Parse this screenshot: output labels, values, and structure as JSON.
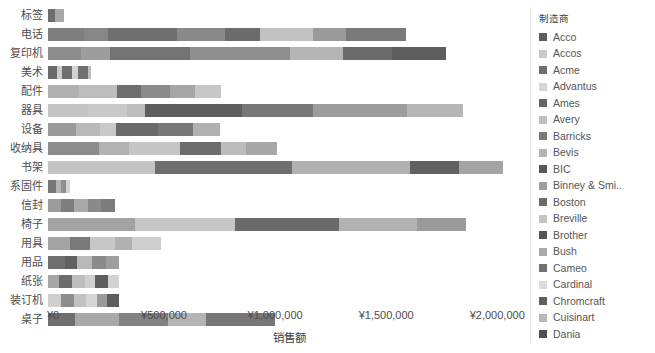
{
  "chart_data": {
    "type": "bar",
    "orientation": "horizontal",
    "stacked": true,
    "title": "",
    "xlabel": "销售额",
    "ylabel": "",
    "grid": false,
    "legend_position": "right",
    "legend_title": "制造商",
    "xlim": [
      0,
      2125000
    ],
    "xticks": [
      0,
      500000,
      1000000,
      1500000,
      2000000
    ],
    "xtick_labels": [
      "¥0",
      "¥500,000",
      "¥1,000,000",
      "¥1,500,000",
      "¥2,000,000"
    ],
    "categories": [
      "标签",
      "电话",
      "复印机",
      "美术",
      "配件",
      "器具",
      "设备",
      "收纳具",
      "书架",
      "系固件",
      "信封",
      "椅子",
      "用具",
      "用品",
      "纸张",
      "装订机",
      "桌子"
    ],
    "series": [
      {
        "name": "Acco",
        "color": "#5c5c5c"
      },
      {
        "name": "Accos",
        "color": "#c9c9c9"
      },
      {
        "name": "Acme",
        "color": "#6e6e6e"
      },
      {
        "name": "Advantus",
        "color": "#d6d6d6"
      },
      {
        "name": "Ames",
        "color": "#666666"
      },
      {
        "name": "Avery",
        "color": "#bfbfbf"
      },
      {
        "name": "Barricks",
        "color": "#7a7a7a"
      },
      {
        "name": "Bevis",
        "color": "#b3b3b3"
      },
      {
        "name": "BIC",
        "color": "#585858"
      },
      {
        "name": "Binney & Smi..",
        "color": "#9e9e9e"
      },
      {
        "name": "Boston",
        "color": "#6a6a6a"
      },
      {
        "name": "Breville",
        "color": "#c4c4c4"
      },
      {
        "name": "Brother",
        "color": "#545454"
      },
      {
        "name": "Bush",
        "color": "#aaaaaa"
      },
      {
        "name": "Cameo",
        "color": "#727272"
      },
      {
        "name": "Cardinal",
        "color": "#dcdcdc"
      },
      {
        "name": "Chromcraft",
        "color": "#5f5f5f"
      },
      {
        "name": "Cuisinart",
        "color": "#b8b8b8"
      },
      {
        "name": "Dania",
        "color": "#4f4f4f"
      }
    ],
    "bars": [
      {
        "category": "标签",
        "total": 70000,
        "segments": [
          {
            "value": 32000,
            "color": "#6e6e6e"
          },
          {
            "value": 38000,
            "color": "#a8a8a8"
          }
        ]
      },
      {
        "category": "电话",
        "total": 1610000,
        "segments": [
          {
            "value": 160000,
            "color": "#7f7f7f"
          },
          {
            "value": 110000,
            "color": "#878787"
          },
          {
            "value": 310000,
            "color": "#6f6f6f"
          },
          {
            "value": 215000,
            "color": "#8a8a8a"
          },
          {
            "value": 160000,
            "color": "#6c6c6c"
          },
          {
            "value": 240000,
            "color": "#c2c2c2"
          },
          {
            "value": 145000,
            "color": "#9a9a9a"
          },
          {
            "value": 270000,
            "color": "#7a7a7a"
          }
        ]
      },
      {
        "category": "复印机",
        "total": 1790000,
        "segments": [
          {
            "value": 150000,
            "color": "#8c8c8c"
          },
          {
            "value": 130000,
            "color": "#9d9d9d"
          },
          {
            "value": 360000,
            "color": "#737373"
          },
          {
            "value": 450000,
            "color": "#8f8f8f"
          },
          {
            "value": 240000,
            "color": "#b5b5b5"
          },
          {
            "value": 220000,
            "color": "#6b6b6b"
          },
          {
            "value": 240000,
            "color": "#5e5e5e"
          }
        ]
      },
      {
        "category": "美术",
        "total": 195000,
        "segments": [
          {
            "value": 40000,
            "color": "#6a6a6a"
          },
          {
            "value": 25000,
            "color": "#cacaca"
          },
          {
            "value": 45000,
            "color": "#6f6f6f"
          },
          {
            "value": 25000,
            "color": "#d2d2d2"
          },
          {
            "value": 45000,
            "color": "#707070"
          },
          {
            "value": 15000,
            "color": "#bdbdbd"
          }
        ]
      },
      {
        "category": "配件",
        "total": 780000,
        "segments": [
          {
            "value": 140000,
            "color": "#b0b0b0"
          },
          {
            "value": 170000,
            "color": "#bdbdbd"
          },
          {
            "value": 110000,
            "color": "#6e6e6e"
          },
          {
            "value": 130000,
            "color": "#8b8b8b"
          },
          {
            "value": 110000,
            "color": "#a5a5a5"
          },
          {
            "value": 120000,
            "color": "#c7c7c7"
          }
        ]
      },
      {
        "category": "器具",
        "total": 1870000,
        "segments": [
          {
            "value": 180000,
            "color": "#c4c4c4"
          },
          {
            "value": 175000,
            "color": "#c9c9c9"
          },
          {
            "value": 80000,
            "color": "#bdbdbd"
          },
          {
            "value": 440000,
            "color": "#5e5e5e"
          },
          {
            "value": 320000,
            "color": "#777777"
          },
          {
            "value": 420000,
            "color": "#9c9c9c"
          },
          {
            "value": 255000,
            "color": "#b6b6b6"
          }
        ]
      },
      {
        "category": "设备",
        "total": 775000,
        "segments": [
          {
            "value": 125000,
            "color": "#9a9a9a"
          },
          {
            "value": 110000,
            "color": "#b9b9b9"
          },
          {
            "value": 70000,
            "color": "#c9c9c9"
          },
          {
            "value": 190000,
            "color": "#6a6a6a"
          },
          {
            "value": 160000,
            "color": "#777777"
          },
          {
            "value": 120000,
            "color": "#b0b0b0"
          }
        ]
      },
      {
        "category": "收纳具",
        "total": 1030000,
        "segments": [
          {
            "value": 230000,
            "color": "#8d8d8d"
          },
          {
            "value": 135000,
            "color": "#b2b2b2"
          },
          {
            "value": 230000,
            "color": "#c6c6c6"
          },
          {
            "value": 185000,
            "color": "#6d6d6d"
          },
          {
            "value": 110000,
            "color": "#bcbcbc"
          },
          {
            "value": 140000,
            "color": "#a7a7a7"
          }
        ]
      },
      {
        "category": "书架",
        "total": 2050000,
        "segments": [
          {
            "value": 480000,
            "color": "#c4c4c4"
          },
          {
            "value": 620000,
            "color": "#6f6f6f"
          },
          {
            "value": 530000,
            "color": "#b1b1b1"
          },
          {
            "value": 220000,
            "color": "#616161"
          },
          {
            "value": 200000,
            "color": "#a4a4a4"
          }
        ]
      },
      {
        "category": "系固件",
        "total": 100000,
        "segments": [
          {
            "value": 35000,
            "color": "#777777"
          },
          {
            "value": 25000,
            "color": "#b4b4b4"
          },
          {
            "value": 20000,
            "color": "#8f8f8f"
          },
          {
            "value": 20000,
            "color": "#d5d5d5"
          }
        ]
      },
      {
        "category": "信封",
        "total": 300000,
        "segments": [
          {
            "value": 60000,
            "color": "#9b9b9b"
          },
          {
            "value": 55000,
            "color": "#7e7e7e"
          },
          {
            "value": 65000,
            "color": "#a9a9a9"
          },
          {
            "value": 60000,
            "color": "#8a8a8a"
          },
          {
            "value": 60000,
            "color": "#7c7c7c"
          }
        ]
      },
      {
        "category": "椅子",
        "total": 1880000,
        "segments": [
          {
            "value": 390000,
            "color": "#a3a3a3"
          },
          {
            "value": 450000,
            "color": "#c7c7c7"
          },
          {
            "value": 470000,
            "color": "#6a6a6a"
          },
          {
            "value": 350000,
            "color": "#b2b2b2"
          },
          {
            "value": 220000,
            "color": "#9a9a9a"
          }
        ]
      },
      {
        "category": "用具",
        "total": 510000,
        "segments": [
          {
            "value": 100000,
            "color": "#a3a3a3"
          },
          {
            "value": 90000,
            "color": "#7a7a7a"
          },
          {
            "value": 110000,
            "color": "#c7c7c7"
          },
          {
            "value": 80000,
            "color": "#b1b1b1"
          },
          {
            "value": 130000,
            "color": "#cfcfcf"
          }
        ]
      },
      {
        "category": "用品",
        "total": 320000,
        "segments": [
          {
            "value": 75000,
            "color": "#6e6e6e"
          },
          {
            "value": 55000,
            "color": "#616161"
          },
          {
            "value": 70000,
            "color": "#b9b9b9"
          },
          {
            "value": 60000,
            "color": "#8a8a8a"
          },
          {
            "value": 60000,
            "color": "#9e9e9e"
          }
        ]
      },
      {
        "category": "纸张",
        "total": 320000,
        "segments": [
          {
            "value": 50000,
            "color": "#a6a6a6"
          },
          {
            "value": 60000,
            "color": "#6c6c6c"
          },
          {
            "value": 55000,
            "color": "#bdbdbd"
          },
          {
            "value": 45000,
            "color": "#cfcfcf"
          },
          {
            "value": 60000,
            "color": "#5e5e5e"
          },
          {
            "value": 50000,
            "color": "#d2d2d2"
          }
        ]
      },
      {
        "category": "装订机",
        "total": 320000,
        "segments": [
          {
            "value": 60000,
            "color": "#cfcfcf"
          },
          {
            "value": 55000,
            "color": "#8d8d8d"
          },
          {
            "value": 55000,
            "color": "#c2c2c2"
          },
          {
            "value": 50000,
            "color": "#d6d6d6"
          },
          {
            "value": 45000,
            "color": "#9a9a9a"
          },
          {
            "value": 55000,
            "color": "#5e5e5e"
          }
        ]
      },
      {
        "category": "桌子",
        "total": 1020000,
        "segments": [
          {
            "value": 120000,
            "color": "#6e6e6e"
          },
          {
            "value": 200000,
            "color": "#a8a8a8"
          },
          {
            "value": 220000,
            "color": "#828282"
          },
          {
            "value": 170000,
            "color": "#b4b4b4"
          },
          {
            "value": 310000,
            "color": "#777777"
          }
        ]
      }
    ]
  },
  "axis": {
    "x_title": "销售额",
    "x_tick_labels": [
      "¥0",
      "¥500,000",
      "¥1,000,000",
      "¥1,500,000",
      "¥2,000,000"
    ]
  },
  "legend": {
    "title": "制造商",
    "items": [
      {
        "label": "Acco",
        "color": "#5c5c5c"
      },
      {
        "label": "Accos",
        "color": "#c9c9c9"
      },
      {
        "label": "Acme",
        "color": "#6e6e6e"
      },
      {
        "label": "Advantus",
        "color": "#d6d6d6"
      },
      {
        "label": "Ames",
        "color": "#666666"
      },
      {
        "label": "Avery",
        "color": "#bfbfbf"
      },
      {
        "label": "Barricks",
        "color": "#7a7a7a"
      },
      {
        "label": "Bevis",
        "color": "#b3b3b3"
      },
      {
        "label": "BIC",
        "color": "#585858"
      },
      {
        "label": "Binney & Smi..",
        "color": "#9e9e9e"
      },
      {
        "label": "Boston",
        "color": "#6a6a6a"
      },
      {
        "label": "Breville",
        "color": "#c4c4c4"
      },
      {
        "label": "Brother",
        "color": "#545454"
      },
      {
        "label": "Bush",
        "color": "#aaaaaa"
      },
      {
        "label": "Cameo",
        "color": "#727272"
      },
      {
        "label": "Cardinal",
        "color": "#dcdcdc"
      },
      {
        "label": "Chromcraft",
        "color": "#5f5f5f"
      },
      {
        "label": "Cuisinart",
        "color": "#b8b8b8"
      },
      {
        "label": "Dania",
        "color": "#4f4f4f"
      }
    ]
  }
}
